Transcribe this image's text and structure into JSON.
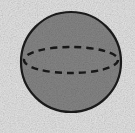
{
  "figure": {
    "kind": "geometric-solid-diagram",
    "canvas": {
      "width": 135,
      "height": 133
    },
    "background_color": "#ebebeb",
    "caption": ""
  },
  "colors": {
    "background": "#ebebeb",
    "sphere_fill": "#8a8a8a",
    "sphere_outline": "#1c1c1c",
    "equator_stroke": "#1a1a1a",
    "grain": "#9a9a9a"
  },
  "shapes": {
    "sphere": {
      "label": "sphere",
      "center_x": 71,
      "center_y": 62,
      "radius": 50,
      "fill": "#8a8a8a",
      "stroke": "#1c1c1c",
      "stroke_width": 2.2,
      "line_style": "solid"
    },
    "equator": {
      "label": "equator",
      "center_x": 71,
      "center_y": 60,
      "radius_x": 47,
      "radius_y": 13,
      "fill": "none",
      "stroke": "#1a1a1a",
      "stroke_width": 2.4,
      "line_style": "dashed",
      "dash_length": 7,
      "dash_gap": 5,
      "dash_array": "7 5"
    }
  },
  "annotations": [],
  "labels": []
}
